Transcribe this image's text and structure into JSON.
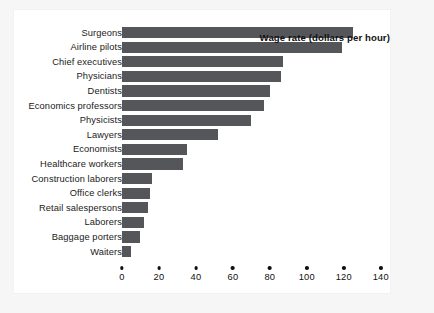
{
  "chart_data": {
    "type": "bar",
    "orientation": "horizontal",
    "title": "",
    "xlabel": "Wage rate (dollars per hour)",
    "ylabel": "",
    "xlim": [
      0,
      145
    ],
    "xticks": [
      0,
      20,
      40,
      60,
      80,
      100,
      120,
      140
    ],
    "xtick_labels": [
      "0",
      "20",
      "40",
      "60",
      "80",
      "100",
      "120",
      "140"
    ],
    "grid": false,
    "legend": false,
    "bar_color": "#55565a",
    "categories": [
      "Surgeons",
      "Airline pilots",
      "Chief executives",
      "Physicians",
      "Dentists",
      "Economics professors",
      "Physicists",
      "Lawyers",
      "Economists",
      "Healthcare workers",
      "Construction laborers",
      "Office clerks",
      "Retail salespersons",
      "Laborers",
      "Baggage porters",
      "Waiters"
    ],
    "values": [
      125,
      119,
      87,
      86,
      80,
      77,
      70,
      52,
      35,
      33,
      16,
      15,
      14,
      12,
      10,
      5
    ]
  }
}
